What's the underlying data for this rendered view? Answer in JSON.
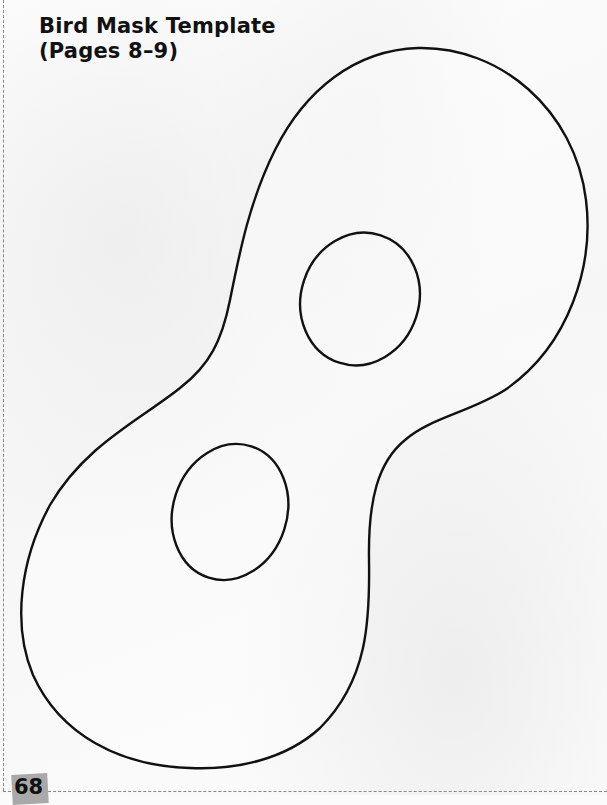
{
  "page": {
    "title_line1": "Bird Mask Template",
    "title_line2": "(Pages 8–9)",
    "page_number": "68"
  },
  "template": {
    "name": "bird-mask",
    "parts": [
      "mask-outline",
      "eye-hole-upper",
      "eye-hole-lower"
    ],
    "stroke_color": "#111111",
    "cut_line_color": "#8a8a8a",
    "badge_color": "#a9a9a9"
  }
}
